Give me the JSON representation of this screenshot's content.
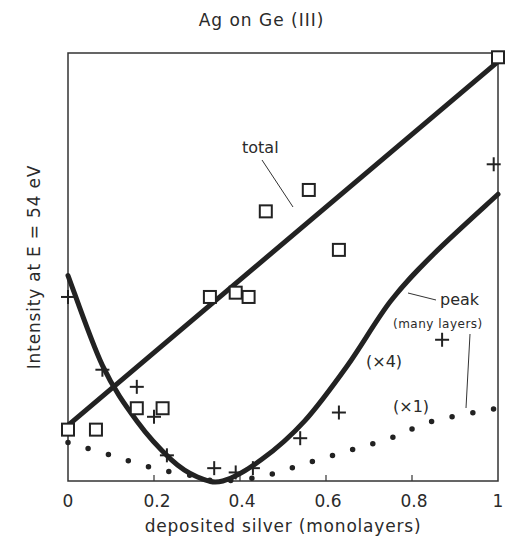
{
  "chart_data": {
    "type": "scatter",
    "title": "Ag on Ge (III)",
    "xlabel": "deposited silver (monolayers)",
    "ylabel": "Intensity  at  E = 54 eV",
    "xlim": [
      0,
      1
    ],
    "ylim": [
      0,
      1
    ],
    "x_ticks": [
      "0",
      "0.2",
      "0.4",
      "0.6",
      "0.8",
      "1"
    ],
    "y_ticks": [],
    "grid": false,
    "legend": "none (inline annotations)",
    "series": [
      {
        "name": "total (squares)",
        "marker": "square",
        "x": [
          0.0,
          0.065,
          0.16,
          0.22,
          0.33,
          0.39,
          0.42,
          0.46,
          0.56,
          0.63,
          1.0
        ],
        "y": [
          0.12,
          0.12,
          0.17,
          0.17,
          0.43,
          0.44,
          0.43,
          0.63,
          0.68,
          0.54,
          0.99
        ]
      },
      {
        "name": "peak (crosses)",
        "marker": "plus",
        "x": [
          0.0,
          0.08,
          0.16,
          0.2,
          0.23,
          0.34,
          0.39,
          0.43,
          0.54,
          0.63,
          0.87,
          0.99
        ],
        "y": [
          0.43,
          0.26,
          0.22,
          0.15,
          0.06,
          0.03,
          0.02,
          0.03,
          0.1,
          0.16,
          0.33,
          0.74
        ]
      },
      {
        "name": "total fit",
        "style": "solid thick line",
        "x": [
          0.0,
          1.0
        ],
        "y": [
          0.13,
          0.98
        ]
      },
      {
        "name": "peak fit (x4)",
        "style": "solid thick curve",
        "x": [
          0.0,
          0.08,
          0.16,
          0.24,
          0.3,
          0.36,
          0.45,
          0.55,
          0.65,
          0.75,
          0.85,
          1.0
        ],
        "y": [
          0.48,
          0.27,
          0.14,
          0.05,
          0.01,
          0.0,
          0.05,
          0.14,
          0.27,
          0.42,
          0.53,
          0.67
        ]
      },
      {
        "name": "peak (many layers) (x1)",
        "style": "dotted curve",
        "x": [
          0.0,
          0.1,
          0.2,
          0.3,
          0.35,
          0.45,
          0.55,
          0.65,
          0.75,
          0.85,
          1.0
        ],
        "y": [
          0.09,
          0.06,
          0.03,
          0.01,
          0.0,
          0.01,
          0.04,
          0.07,
          0.1,
          0.14,
          0.17
        ]
      }
    ],
    "annotations": [
      {
        "text": "total",
        "points_to": "total fit"
      },
      {
        "text": "peak",
        "points_to": "peak fit"
      },
      {
        "text": "(many layers)",
        "points_to": "dotted curve"
      },
      {
        "text": "(×4)",
        "near": "peak fit"
      },
      {
        "text": "(×1)",
        "near": "dotted curve"
      }
    ]
  },
  "labels": {
    "title": "Ag on Ge (III)",
    "xlabel": "deposited silver (monolayers)",
    "ylabel": "Intensity  at  E = 54 eV",
    "ticks": [
      "0",
      "0.2",
      "0.4",
      "0.6",
      "0.8",
      "1"
    ],
    "total": "total",
    "peak": "peak",
    "many_layers": "(many layers)",
    "x4": "(×4)",
    "x1": "(×1)"
  }
}
